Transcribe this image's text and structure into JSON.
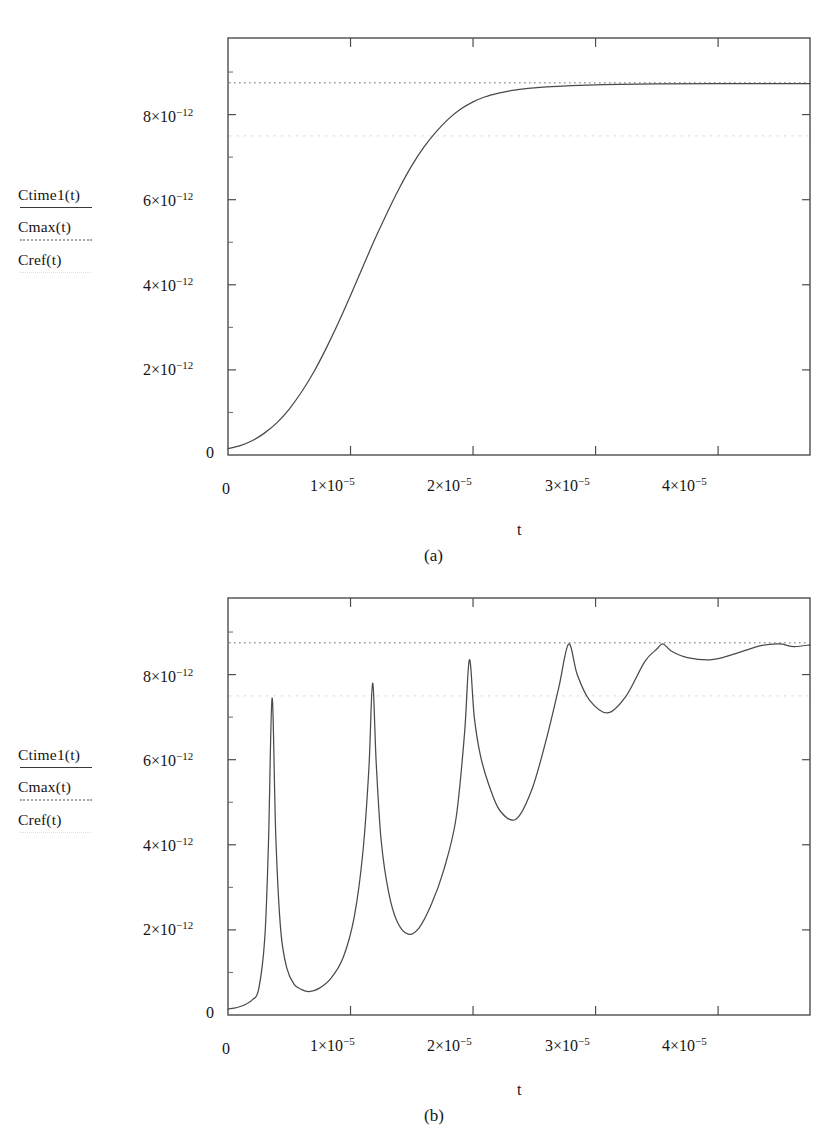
{
  "figure": {
    "panels": [
      {
        "caption": "(a)",
        "xlabel": "t",
        "legend": [
          {
            "name": "Ctime1(t)",
            "style": "solid"
          },
          {
            "name": "Cmax(t)",
            "style": "dotted"
          },
          {
            "name": "Cref(t)",
            "style": "faint-dotted"
          }
        ]
      },
      {
        "caption": "(b)",
        "xlabel": "t",
        "legend": [
          {
            "name": "Ctime1(t)",
            "style": "solid"
          },
          {
            "name": "Cmax(t)",
            "style": "dotted"
          },
          {
            "name": "Cref(t)",
            "style": "faint-dotted"
          }
        ]
      }
    ]
  },
  "chart_data": [
    {
      "type": "line",
      "panel": "(a)",
      "title": "",
      "xlabel": "t",
      "ylabel": "",
      "xlim": [
        0,
        4.75e-05
      ],
      "ylim": [
        0,
        9.8e-12
      ],
      "xticks": [
        0,
        1e-05,
        2e-05,
        3e-05,
        4e-05
      ],
      "xticklabels": [
        "0",
        "1×10⁻⁵",
        "2×10⁻⁵",
        "3×10⁻⁵",
        "4×10⁻⁵"
      ],
      "yticks": [
        0,
        2e-12,
        4e-12,
        6e-12,
        8e-12
      ],
      "yticklabels": [
        "0",
        "2×10⁻¹²",
        "4×10⁻¹²",
        "6×10⁻¹²",
        "8×10⁻¹²"
      ],
      "grid": false,
      "legend_position": "left-outside",
      "series": [
        {
          "name": "Ctime1(t)",
          "style": "solid",
          "color": "#4a4a4a",
          "x": [
            0.0,
            1e-06,
            2e-06,
            3e-06,
            4e-06,
            5e-06,
            6e-06,
            7e-06,
            8e-06,
            9e-06,
            1e-05,
            1.1e-05,
            1.2e-05,
            1.3e-05,
            1.4e-05,
            1.5e-05,
            1.6e-05,
            1.7e-05,
            1.8e-05,
            1.9e-05,
            2e-05,
            2.1e-05,
            2.2e-05,
            2.3e-05,
            2.4e-05,
            2.5e-05,
            2.6e-05,
            2.8e-05,
            3e-05,
            3.2e-05,
            3.5e-05,
            4e-05,
            4.75e-05
          ],
          "y": [
            1.5e-13,
            2.2e-13,
            3.4e-13,
            5.2e-13,
            7.6e-13,
            1.08e-12,
            1.48e-12,
            1.95e-12,
            2.5e-12,
            3.1e-12,
            3.75e-12,
            4.42e-12,
            5.08e-12,
            5.7e-12,
            6.28e-12,
            6.8e-12,
            7.24e-12,
            7.6e-12,
            7.9e-12,
            8.13e-12,
            8.3e-12,
            8.42e-12,
            8.5e-12,
            8.56e-12,
            8.6e-12,
            8.63e-12,
            8.65e-12,
            8.68e-12,
            8.7e-12,
            8.71e-12,
            8.72e-12,
            8.73e-12,
            8.73e-12
          ]
        },
        {
          "name": "Cmax(t)",
          "style": "dotted",
          "color": "#9a9a9a",
          "constant": 8.75e-12
        },
        {
          "name": "Cref(t)",
          "style": "faint-dotted",
          "color": "#e0e0e0",
          "constant": 7.5e-12
        }
      ]
    },
    {
      "type": "line",
      "panel": "(b)",
      "title": "",
      "xlabel": "t",
      "ylabel": "",
      "xlim": [
        0,
        4.75e-05
      ],
      "ylim": [
        0,
        9.8e-12
      ],
      "xticks": [
        0,
        1e-05,
        2e-05,
        3e-05,
        4e-05
      ],
      "xticklabels": [
        "0",
        "1×10⁻⁵",
        "2×10⁻⁵",
        "3×10⁻⁵",
        "4×10⁻⁵"
      ],
      "yticks": [
        0,
        2e-12,
        4e-12,
        6e-12,
        8e-12
      ],
      "yticklabels": [
        "0",
        "2×10⁻¹²",
        "4×10⁻¹²",
        "6×10⁻¹²",
        "8×10⁻¹²"
      ],
      "grid": false,
      "legend_position": "left-outside",
      "peaks": [
        {
          "x": 3.6e-06,
          "y": 7.45e-12
        },
        {
          "x": 1.18e-05,
          "y": 7.8e-12
        },
        {
          "x": 1.97e-05,
          "y": 8.35e-12
        },
        {
          "x": 2.78e-05,
          "y": 8.72e-12
        },
        {
          "x": 3.55e-05,
          "y": 8.72e-12
        }
      ],
      "troughs": [
        {
          "x": 6.6e-06,
          "y": 5.5e-13
        },
        {
          "x": 1.47e-05,
          "y": 1.9e-12
        },
        {
          "x": 2.35e-05,
          "y": 4.6e-12
        },
        {
          "x": 3.1e-05,
          "y": 7.1e-12
        },
        {
          "x": 3.95e-05,
          "y": 8.35e-12
        }
      ],
      "series": [
        {
          "name": "Ctime1(t)",
          "style": "solid",
          "color": "#4a4a4a",
          "x": [
            0.0,
            5e-07,
            1e-06,
            1.5e-06,
            2e-06,
            2.5e-06,
            3e-06,
            3.3e-06,
            3.6e-06,
            3.9e-06,
            4.3e-06,
            4.8e-06,
            5.4e-06,
            6e-06,
            6.6e-06,
            7.4e-06,
            8.4e-06,
            9.4e-06,
            1.03e-05,
            1.1e-05,
            1.15e-05,
            1.18e-05,
            1.21e-05,
            1.25e-05,
            1.31e-05,
            1.38e-05,
            1.47e-05,
            1.56e-05,
            1.66e-05,
            1.76e-05,
            1.86e-05,
            1.93e-05,
            1.97e-05,
            2.01e-05,
            2.06e-05,
            2.13e-05,
            2.22e-05,
            2.35e-05,
            2.48e-05,
            2.6e-05,
            2.7e-05,
            2.78e-05,
            2.85e-05,
            2.95e-05,
            3.1e-05,
            3.25e-05,
            3.4e-05,
            3.5e-05,
            3.55e-05,
            3.62e-05,
            3.75e-05,
            3.95e-05,
            4.15e-05,
            4.35e-05,
            4.5e-05,
            4.62e-05,
            4.75e-05
          ],
          "y": [
            1.4e-13,
            1.6e-13,
            2e-13,
            2.6e-13,
            3.6e-13,
            6e-13,
            1.8e-12,
            4e-12,
            7.45e-12,
            4.2e-12,
            2e-12,
            1.1e-12,
            7.2e-13,
            6e-13,
            5.5e-13,
            6.2e-13,
            8.6e-13,
            1.35e-12,
            2.3e-12,
            3.8e-12,
            5.8e-12,
            7.8e-12,
            5.9e-12,
            4.1e-12,
            2.9e-12,
            2.2e-12,
            1.9e-12,
            2.05e-12,
            2.6e-12,
            3.4e-12,
            4.6e-12,
            6.6e-12,
            8.35e-12,
            7e-12,
            6.1e-12,
            5.4e-12,
            4.8e-12,
            4.6e-12,
            5.3e-12,
            6.5e-12,
            7.7e-12,
            8.72e-12,
            8e-12,
            7.4e-12,
            7.1e-12,
            7.5e-12,
            8.3e-12,
            8.6e-12,
            8.72e-12,
            8.55e-12,
            8.4e-12,
            8.35e-12,
            8.5e-12,
            8.68e-12,
            8.72e-12,
            8.66e-12,
            8.7e-12
          ]
        },
        {
          "name": "Cmax(t)",
          "style": "dotted",
          "color": "#9a9a9a",
          "constant": 8.75e-12
        },
        {
          "name": "Cref(t)",
          "style": "faint-dotted",
          "color": "#e0e0e0",
          "constant": 7.5e-12
        }
      ]
    }
  ]
}
